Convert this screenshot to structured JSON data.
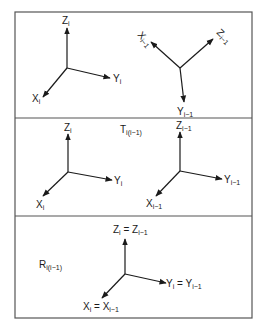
{
  "figure": {
    "panels": [
      {
        "id": "panel-1",
        "frames": [
          {
            "id": "frame-i",
            "origin": [
              67,
              68
            ],
            "axes": [
              {
                "name": "Z",
                "sub": "i",
                "end": [
                  67,
                  28
                ],
                "label_pos": [
                  62,
                  24
                ]
              },
              {
                "name": "Y",
                "sub": "i",
                "end": [
                  110,
                  78
                ],
                "label_pos": [
                  113,
                  82
                ]
              },
              {
                "name": "X",
                "sub": "i",
                "end": [
                  43,
                  97
                ],
                "label_pos": [
                  32,
                  102
                ]
              }
            ]
          },
          {
            "id": "frame-i-minus-1-rotated",
            "origin": [
              180,
              68
            ],
            "axes": [
              {
                "name": "X",
                "sub": "i−1",
                "end": [
                  151,
                  42
                ],
                "label_pos": [
                  137,
                  35
                ],
                "rotate": 50
              },
              {
                "name": "Z",
                "sub": "i−1",
                "end": [
                  213,
                  39
                ],
                "label_pos": [
                  216,
                  33
                ],
                "rotate": 45
              },
              {
                "name": "Y",
                "sub": "i−1",
                "end": [
                  184,
                  102
                ],
                "label_pos": [
                  177,
                  115
                ]
              }
            ]
          }
        ]
      },
      {
        "id": "panel-2",
        "transform_label": {
          "main": "T",
          "sub": "i(i−1)",
          "pos": [
            120,
            133
          ]
        },
        "frames": [
          {
            "id": "frame-i",
            "origin": [
              68,
              172
            ],
            "axes": [
              {
                "name": "Z",
                "sub": "i",
                "end": [
                  68,
                  134
                ],
                "label_pos": [
                  64,
                  131
                ]
              },
              {
                "name": "Y",
                "sub": "i",
                "end": [
                  112,
                  180
                ],
                "label_pos": [
                  114,
                  184
                ]
              },
              {
                "name": "X",
                "sub": "i",
                "end": [
                  43,
                  196
                ],
                "label_pos": [
                  36,
                  208
                ]
              }
            ]
          },
          {
            "id": "frame-i-minus-1",
            "origin": [
              180,
              171
            ],
            "axes": [
              {
                "name": "Z",
                "sub": "i−1",
                "end": [
                  180,
                  132
                ],
                "label_pos": [
                  176,
                  129
                ]
              },
              {
                "name": "Y",
                "sub": "i−1",
                "end": [
                  222,
                  179
                ],
                "label_pos": [
                  224,
                  183
                ]
              },
              {
                "name": "X",
                "sub": "i−1",
                "end": [
                  156,
                  196
                ],
                "label_pos": [
                  146,
                  207
                ]
              }
            ]
          }
        ]
      },
      {
        "id": "panel-3",
        "transform_label": {
          "main": "R",
          "sub": "i(i−1)",
          "pos": [
            39,
            268
          ]
        },
        "frames": [
          {
            "id": "frame-coincident",
            "origin": [
              125,
              274
            ],
            "axes": [
              {
                "name": "Z",
                "sub": "i",
                "eq_name": "Z",
                "eq_sub": "i−1",
                "end": [
                  125,
                  239
                ],
                "label_pos": [
                  113,
                  233
                ]
              },
              {
                "name": "Y",
                "sub": "i",
                "eq_name": "Y",
                "eq_sub": "i−1",
                "end": [
                  166,
                  283
                ],
                "label_pos": [
                  166,
                  287
                ]
              },
              {
                "name": "X",
                "sub": "i",
                "eq_name": "X",
                "eq_sub": "i−1",
                "end": [
                  102,
                  298
                ],
                "label_pos": [
                  83,
                  310
                ]
              }
            ]
          }
        ]
      }
    ],
    "border": {
      "x": 15,
      "y": 12,
      "w": 237,
      "h": 306
    },
    "dividers_y": [
      118,
      216
    ],
    "colors": {
      "line": "#1a1a1a",
      "frame": "#555555",
      "background": "#ffffff"
    }
  }
}
